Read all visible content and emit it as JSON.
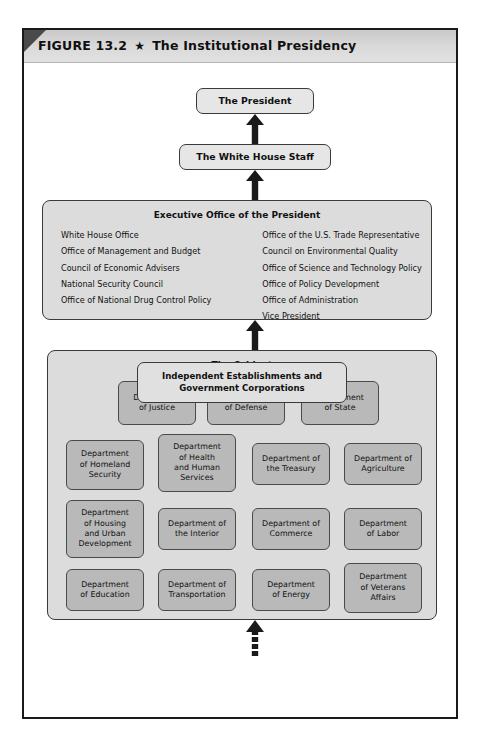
{
  "figure": {
    "number": "FIGURE 13.2",
    "star_icon": "★",
    "title": "The Institutional Presidency"
  },
  "nodes": {
    "president": "The President",
    "white_house_staff": "The White House Staff",
    "independent": "Independent Establishments and\nGovernment Corporations",
    "independent_line1": "Independent Establishments and",
    "independent_line2": "Government Corporations"
  },
  "eop": {
    "title": "Executive Office of the President",
    "left_items": [
      "White House Office",
      "Office of Management and Budget",
      "Council of Economic Advisers",
      "National Security Council",
      "Office of National Drug Control Policy"
    ],
    "right_items": [
      "Office of the U.S. Trade Representative",
      "Council on Environmental Quality",
      "Office of Science and Technology Policy",
      "Office of Policy Development",
      "Office of Administration",
      "Vice President"
    ]
  },
  "cabinet": {
    "title": "The Cabinet",
    "departments": [
      {
        "label": "Department\nof Justice",
        "lines": [
          "Department",
          "of Justice"
        ]
      },
      {
        "label": "Department\nof Defense",
        "lines": [
          "Department",
          "of Defense"
        ]
      },
      {
        "label": "Department\nof State",
        "lines": [
          "Department",
          "of State"
        ]
      },
      {
        "label": "Department\nof Homeland\nSecurity",
        "lines": [
          "Department",
          "of Homeland",
          "Security"
        ]
      },
      {
        "label": "Department\nof Health\nand Human\nServices",
        "lines": [
          "Department",
          "of Health",
          "and Human",
          "Services"
        ]
      },
      {
        "label": "Department of\nthe Treasury",
        "lines": [
          "Department of",
          "the Treasury"
        ]
      },
      {
        "label": "Department of\nAgriculture",
        "lines": [
          "Department of",
          "Agriculture"
        ]
      },
      {
        "label": "Department\nof Housing\nand Urban\nDevelopment",
        "lines": [
          "Department",
          "of Housing",
          "and Urban",
          "Development"
        ]
      },
      {
        "label": "Department of\nthe Interior",
        "lines": [
          "Department of",
          "the Interior"
        ]
      },
      {
        "label": "Department of\nCommerce",
        "lines": [
          "Department of",
          "Commerce"
        ]
      },
      {
        "label": "Department\nof Labor",
        "lines": [
          "Department",
          "of Labor"
        ]
      },
      {
        "label": "Department\nof Education",
        "lines": [
          "Department",
          "of Education"
        ]
      },
      {
        "label": "Department of\nTransportation",
        "lines": [
          "Department of",
          "Transportation"
        ]
      },
      {
        "label": "Department\nof Energy",
        "lines": [
          "Department",
          "of Energy"
        ]
      },
      {
        "label": "Department\nof Veterans\nAffairs",
        "lines": [
          "Department",
          "of Veterans",
          "Affairs"
        ]
      }
    ]
  },
  "arrows": [
    {
      "name": "arrow-staff-to-president",
      "style": "solid"
    },
    {
      "name": "arrow-eop-to-staff",
      "style": "solid"
    },
    {
      "name": "arrow-cabinet-to-eop",
      "style": "solid"
    },
    {
      "name": "arrow-independent-to-cabinet",
      "style": "dashed"
    }
  ],
  "colors": {
    "frame_border": "#1a1a1a",
    "header_bar": "#d8d8d8",
    "corner_triangle": "#4a4a4a",
    "node_fill": "#e6e6e6",
    "group_fill": "#dcdcdc",
    "dept_fill": "#b9b9b9",
    "arrow": "#1a1a1a",
    "text": "#111111"
  }
}
